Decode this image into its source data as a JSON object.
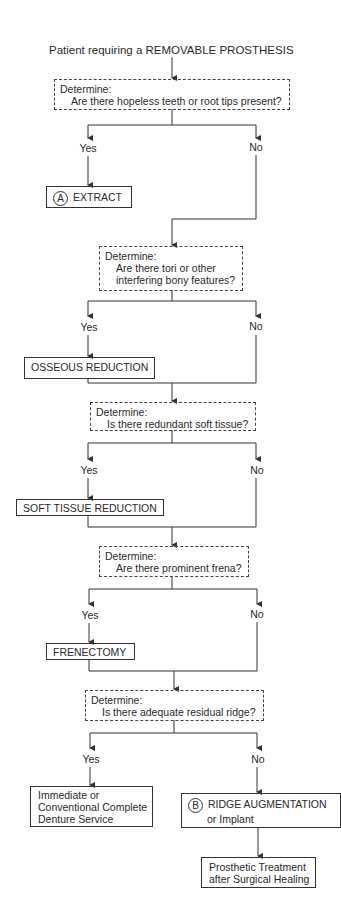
{
  "title": "Patient requiring a REMOVABLE PROSTHESIS",
  "decisions": [
    {
      "heading": "Determine:",
      "question": "Are there hopeless teeth or root tips present?"
    },
    {
      "heading": "Determine:",
      "question_line1": "Are there tori or other",
      "question_line2": "interfering bony features?"
    },
    {
      "heading": "Determine:",
      "question": "Is there redundant soft tissue?"
    },
    {
      "heading": "Determine:",
      "question": "Are there prominent frena?"
    },
    {
      "heading": "Determine:",
      "question": "Is there adequate residual ridge?"
    }
  ],
  "branch_labels": {
    "yes": "Yes",
    "no": "No"
  },
  "actions": {
    "extract": {
      "marker": "A",
      "label": "EXTRACT"
    },
    "osseous": {
      "label": "OSSEOUS REDUCTION"
    },
    "soft_tissue": {
      "label": "SOFT TISSUE REDUCTION"
    },
    "frenectomy": {
      "label": "FRENECTOMY"
    },
    "denture": {
      "line1": "Immediate or",
      "line2": "Conventional Complete",
      "line3": "Denture Service"
    },
    "ridge": {
      "marker": "B",
      "line1": "RIDGE AUGMENTATION",
      "line2": "or Implant"
    },
    "prosthetic": {
      "line1": "Prosthetic Treatment",
      "line2": "after Surgical Healing"
    }
  },
  "colors": {
    "line": "#333333",
    "text": "#2a2a2a",
    "background": "#ffffff"
  }
}
